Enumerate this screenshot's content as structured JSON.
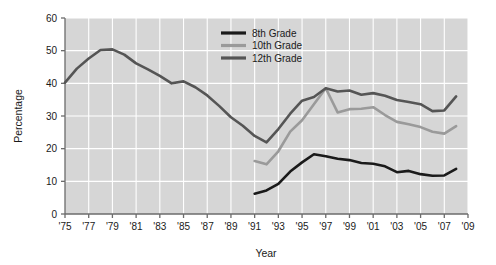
{
  "chart_data": {
    "type": "line",
    "title": "",
    "subtitle": "",
    "xlabel": "Year",
    "ylabel": "Percentage",
    "xlim": [
      1975,
      2009
    ],
    "ylim": [
      0,
      60
    ],
    "grid": true,
    "legend_position": "top-center-right",
    "xticks": [
      "'75",
      "'77",
      "'79",
      "'81",
      "'83",
      "'85",
      "'87",
      "'89",
      "'91",
      "'93",
      "'95",
      "'97",
      "'99",
      "'01",
      "'03",
      "'05",
      "'07",
      "'09"
    ],
    "xtick_values": [
      1975,
      1977,
      1979,
      1981,
      1983,
      1985,
      1987,
      1989,
      1991,
      1993,
      1995,
      1997,
      1999,
      2001,
      2003,
      2005,
      2007,
      2009
    ],
    "yticks": [
      "0",
      "10",
      "20",
      "30",
      "40",
      "50",
      "60"
    ],
    "ytick_values": [
      0,
      10,
      20,
      30,
      40,
      50,
      60
    ],
    "series": [
      {
        "name": "8th Grade",
        "color": "#1a1a1a",
        "x": [
          1991,
          1992,
          1993,
          1994,
          1995,
          1996,
          1997,
          1998,
          1999,
          2000,
          2001,
          2002,
          2003,
          2004,
          2005,
          2006,
          2007,
          2008
        ],
        "values": [
          6.2,
          7.2,
          9.2,
          13.0,
          15.8,
          18.3,
          17.7,
          16.9,
          16.5,
          15.6,
          15.4,
          14.6,
          12.8,
          13.2,
          12.2,
          11.7,
          11.8,
          13.8
        ]
      },
      {
        "name": "10th Grade",
        "color": "#9a9a9a",
        "x": [
          1991,
          1992,
          1993,
          1994,
          1995,
          1996,
          1997,
          1998,
          1999,
          2000,
          2001,
          2002,
          2003,
          2004,
          2005,
          2006,
          2007,
          2008
        ],
        "values": [
          16.2,
          15.2,
          19.2,
          25.2,
          28.7,
          33.6,
          38.5,
          31.1,
          32.1,
          32.2,
          32.7,
          30.3,
          28.2,
          27.5,
          26.6,
          25.2,
          24.6,
          26.9
        ]
      },
      {
        "name": "12th Grade",
        "color": "#555555",
        "x": [
          1975,
          1976,
          1977,
          1978,
          1979,
          1980,
          1981,
          1982,
          1983,
          1984,
          1985,
          1986,
          1987,
          1988,
          1989,
          1990,
          1991,
          1992,
          1993,
          1994,
          1995,
          1996,
          1997,
          1998,
          1999,
          2000,
          2001,
          2002,
          2003,
          2004,
          2005,
          2006,
          2007,
          2008
        ],
        "values": [
          40.2,
          44.5,
          47.6,
          50.2,
          50.4,
          48.8,
          46.1,
          44.3,
          42.3,
          40.0,
          40.6,
          38.8,
          36.3,
          33.1,
          29.6,
          27.0,
          23.9,
          21.9,
          26.0,
          30.7,
          34.7,
          35.8,
          38.5,
          37.5,
          37.8,
          36.5,
          37.0,
          36.2,
          34.9,
          34.3,
          33.6,
          31.5,
          31.7,
          36.0
        ]
      }
    ]
  },
  "legend": {
    "items": [
      {
        "label": "8th Grade",
        "color": "#1a1a1a"
      },
      {
        "label": "10th Grade",
        "color": "#9a9a9a"
      },
      {
        "label": "12th Grade",
        "color": "#555555"
      }
    ]
  },
  "axes": {
    "y_title": "Percentage",
    "x_title": "Year"
  },
  "theme": {
    "plot_background": "#d6d6d6",
    "gridline_color": "#ffffff",
    "axis_color": "#6b6b6b",
    "page_background": "#ffffff",
    "text_color": "#1a1a1a"
  }
}
